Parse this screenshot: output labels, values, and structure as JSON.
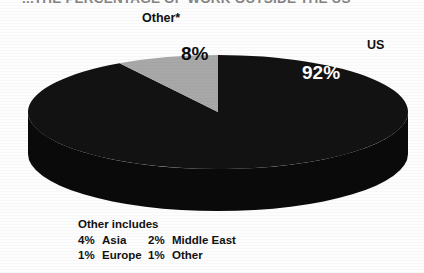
{
  "figure": {
    "title": "...THE PERCENTAGE OF WORK OUTSIDE THE US",
    "background_color": "#fdfdfd"
  },
  "chart_data": {
    "type": "pie",
    "title": "...THE PERCENTAGE OF WORK OUTSIDE THE US",
    "style": "3d-ellipse",
    "categories": [
      "US",
      "Other*"
    ],
    "values": [
      92,
      8
    ],
    "value_labels": [
      "92%",
      "8%"
    ],
    "colors": [
      "#121212",
      "#a8a8a8"
    ],
    "label_colors": [
      "#ffffff",
      "#0d0d0d"
    ],
    "callouts": [
      {
        "name": "us-callout",
        "text": "US"
      },
      {
        "name": "other-callout",
        "text": "Other*"
      }
    ],
    "legend_position": "below",
    "grid": false
  },
  "pie": {
    "center_x": 218,
    "center_y": 112,
    "radius_x": 190,
    "radius_y": 57,
    "depth": 42,
    "slices": [
      {
        "name": "us",
        "label": "US",
        "value_label": "92%",
        "color": "#121212",
        "start_deg": -90,
        "end_deg": 238.8
      },
      {
        "name": "other",
        "label": "Other*",
        "value_label": "8%",
        "color": "#a8a8a8",
        "start_deg": 238.8,
        "end_deg": 270
      }
    ],
    "side_color": "#0a0a0a"
  },
  "annotations": {
    "other_label": "Other*",
    "us_label": "US",
    "gray_value": "8%",
    "dark_value": "92%"
  },
  "legend": {
    "title": "Other includes",
    "rows": [
      {
        "c1_pct": "4%",
        "c1_name": "Asia",
        "c2_pct": "2%",
        "c2_name": "Middle East"
      },
      {
        "c1_pct": "1%",
        "c1_name": "Europe",
        "c2_pct": "1%",
        "c2_name": "Other"
      }
    ]
  }
}
